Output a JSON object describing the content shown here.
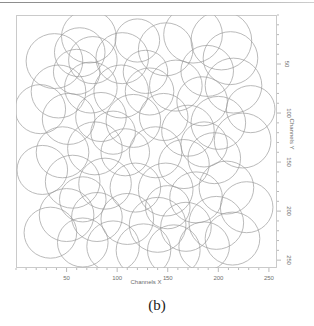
{
  "figure": {
    "caption": "(b)",
    "frame_color": "#b5b5b5",
    "circle_color": "#9a9a9a",
    "background": "#ffffff"
  },
  "chart_data": {
    "type": "scatter",
    "title": "",
    "subtitle": "",
    "xlabel": "Channels X",
    "ylabel": "Channels Y",
    "xlim": [
      0,
      258
    ],
    "ylim": [
      258,
      0
    ],
    "y_axis_position": "right",
    "y_axis_inverted": true,
    "grid": false,
    "legend": null,
    "annotations": [
      "(b)"
    ],
    "xticks": [
      50,
      100,
      150,
      200,
      250
    ],
    "xtick_labels": [
      "50",
      "100",
      "150",
      "200",
      "250"
    ],
    "yticks": [
      50,
      100,
      150,
      200,
      250
    ],
    "ytick_labels": [
      "50",
      "100",
      "150",
      "200",
      "250"
    ],
    "minor_tick_interval": 10,
    "marker": "open-circle",
    "series": [
      {
        "name": "circles",
        "units": "channels",
        "points": [
          {
            "x": 72,
            "y": 22,
            "r": 27
          },
          {
            "x": 63,
            "y": 38,
            "r": 25
          },
          {
            "x": 38,
            "y": 47,
            "r": 28
          },
          {
            "x": 76,
            "y": 46,
            "r": 24
          },
          {
            "x": 105,
            "y": 44,
            "r": 26
          },
          {
            "x": 120,
            "y": 26,
            "r": 22
          },
          {
            "x": 148,
            "y": 35,
            "r": 27
          },
          {
            "x": 175,
            "y": 20,
            "r": 29
          },
          {
            "x": 203,
            "y": 26,
            "r": 30
          },
          {
            "x": 212,
            "y": 44,
            "r": 27
          },
          {
            "x": 189,
            "y": 57,
            "r": 26
          },
          {
            "x": 215,
            "y": 72,
            "r": 28
          },
          {
            "x": 184,
            "y": 88,
            "r": 25
          },
          {
            "x": 158,
            "y": 72,
            "r": 26
          },
          {
            "x": 132,
            "y": 78,
            "r": 24
          },
          {
            "x": 104,
            "y": 78,
            "r": 27
          },
          {
            "x": 74,
            "y": 74,
            "r": 26
          },
          {
            "x": 42,
            "y": 78,
            "r": 27
          },
          {
            "x": 24,
            "y": 96,
            "r": 25
          },
          {
            "x": 52,
            "y": 106,
            "r": 26
          },
          {
            "x": 84,
            "y": 104,
            "r": 25
          },
          {
            "x": 116,
            "y": 108,
            "r": 27
          },
          {
            "x": 146,
            "y": 104,
            "r": 24
          },
          {
            "x": 170,
            "y": 118,
            "r": 26
          },
          {
            "x": 200,
            "y": 110,
            "r": 27
          },
          {
            "x": 224,
            "y": 128,
            "r": 28
          },
          {
            "x": 196,
            "y": 146,
            "r": 26
          },
          {
            "x": 166,
            "y": 152,
            "r": 25
          },
          {
            "x": 138,
            "y": 140,
            "r": 26
          },
          {
            "x": 108,
            "y": 140,
            "r": 24
          },
          {
            "x": 78,
            "y": 136,
            "r": 27
          },
          {
            "x": 46,
            "y": 140,
            "r": 26
          },
          {
            "x": 26,
            "y": 158,
            "r": 25
          },
          {
            "x": 56,
            "y": 170,
            "r": 27
          },
          {
            "x": 88,
            "y": 172,
            "r": 26
          },
          {
            "x": 118,
            "y": 176,
            "r": 25
          },
          {
            "x": 148,
            "y": 178,
            "r": 27
          },
          {
            "x": 178,
            "y": 186,
            "r": 26
          },
          {
            "x": 208,
            "y": 176,
            "r": 27
          },
          {
            "x": 228,
            "y": 196,
            "r": 26
          },
          {
            "x": 198,
            "y": 212,
            "r": 27
          },
          {
            "x": 168,
            "y": 216,
            "r": 25
          },
          {
            "x": 140,
            "y": 214,
            "r": 28
          },
          {
            "x": 110,
            "y": 208,
            "r": 26
          },
          {
            "x": 80,
            "y": 206,
            "r": 25
          },
          {
            "x": 50,
            "y": 204,
            "r": 27
          },
          {
            "x": 34,
            "y": 222,
            "r": 26
          },
          {
            "x": 66,
            "y": 232,
            "r": 25
          },
          {
            "x": 96,
            "y": 236,
            "r": 26
          },
          {
            "x": 126,
            "y": 240,
            "r": 27
          },
          {
            "x": 156,
            "y": 240,
            "r": 26
          },
          {
            "x": 186,
            "y": 236,
            "r": 25
          },
          {
            "x": 214,
            "y": 228,
            "r": 27
          },
          {
            "x": 232,
            "y": 96,
            "r": 24
          },
          {
            "x": 128,
            "y": 58,
            "r": 22
          },
          {
            "x": 60,
            "y": 58,
            "r": 23
          },
          {
            "x": 96,
            "y": 120,
            "r": 22
          },
          {
            "x": 186,
            "y": 132,
            "r": 23
          },
          {
            "x": 66,
            "y": 188,
            "r": 23
          },
          {
            "x": 150,
            "y": 196,
            "r": 22
          }
        ]
      }
    ]
  }
}
